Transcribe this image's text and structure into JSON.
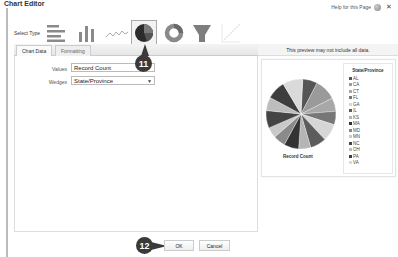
{
  "window": {
    "title": "Chart Editor",
    "help_link": "Help for this Page",
    "help_icon": "help-icon",
    "close_icon": "close-icon"
  },
  "select_type": {
    "label": "Select Type",
    "types": [
      {
        "name": "horizontal-bar",
        "icon": "horizontal-bar-chart-icon",
        "selected": false
      },
      {
        "name": "vertical-column",
        "icon": "vertical-column-chart-icon",
        "selected": false
      },
      {
        "name": "line",
        "icon": "line-chart-icon",
        "selected": false
      },
      {
        "name": "pie",
        "icon": "pie-chart-icon",
        "selected": true
      },
      {
        "name": "donut",
        "icon": "donut-chart-icon",
        "selected": false
      },
      {
        "name": "funnel",
        "icon": "funnel-chart-icon",
        "selected": false
      },
      {
        "name": "scatter",
        "icon": "scatter-chart-icon",
        "selected": false
      }
    ]
  },
  "tabs": [
    {
      "label": "Chart Data",
      "active": true
    },
    {
      "label": "Formatting",
      "active": false
    }
  ],
  "chart_data_form": {
    "values_label": "Values",
    "values_value": "Record Count",
    "wedges_label": "Wedges",
    "wedges_value": "State/Province"
  },
  "preview": {
    "notice": "This preview may not include all data.",
    "caption": "Record Count",
    "legend_title": "State/Province",
    "legend": [
      {
        "label": "AL",
        "color": "#555555"
      },
      {
        "label": "CA",
        "color": "#9a9a9a"
      },
      {
        "label": "CT",
        "color": "#a8a8a8"
      },
      {
        "label": "FL",
        "color": "#777777"
      },
      {
        "label": "GA",
        "color": "#d6d6d6"
      },
      {
        "label": "IL",
        "color": "#5c5c5c"
      },
      {
        "label": "KS",
        "color": "#b5b5b5"
      },
      {
        "label": "MA",
        "color": "#333333"
      },
      {
        "label": "MD",
        "color": "#8a8a8a"
      },
      {
        "label": "MN",
        "color": "#c9c9c9"
      },
      {
        "label": "NC",
        "color": "#444444"
      },
      {
        "label": "OH",
        "color": "#bdbdbd"
      },
      {
        "label": "PA",
        "color": "#3d3d3d"
      },
      {
        "label": "VA",
        "color": "#dadada"
      }
    ]
  },
  "callouts": {
    "step_11": "11",
    "step_12": "12"
  },
  "buttons": {
    "ok": "OK",
    "cancel": "Cancel"
  }
}
